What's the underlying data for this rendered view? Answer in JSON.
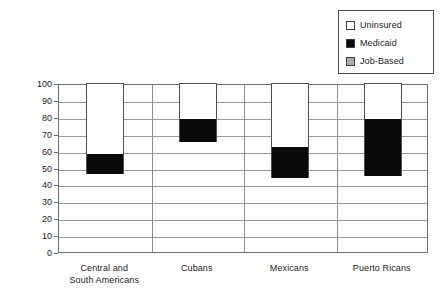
{
  "chart_data": {
    "type": "bar",
    "subtype": "stacked-bar",
    "title": "",
    "xlabel": "",
    "ylabel": "Health Insurance Coverage (percent)",
    "ylim": [
      0,
      100
    ],
    "ytick_step": 10,
    "yticks": [
      100,
      90,
      80,
      70,
      60,
      50,
      40,
      30,
      20,
      10,
      0
    ],
    "grid": "horizontal-and-vertical",
    "legend_position": "top-right",
    "categories": [
      "Central and South Americans",
      "Cubans",
      "Mexicans",
      "Puerto Ricans"
    ],
    "category_lines": [
      [
        "Central and",
        "South Americans"
      ],
      [
        "Cubans",
        ""
      ],
      [
        "Mexicans",
        ""
      ],
      [
        "Puerto Ricans",
        ""
      ]
    ],
    "series": [
      {
        "name": "Job-Based",
        "color": "#ababab",
        "values": [
          46,
          65,
          44,
          45
        ]
      },
      {
        "name": "Medicaid",
        "color": "#0a0a0a",
        "values": [
          12,
          14,
          18,
          34
        ]
      },
      {
        "name": "Uninsured",
        "color": "#ffffff",
        "values": [
          42,
          21,
          38,
          21
        ]
      }
    ],
    "stack_tops": [
      58,
      79,
      62,
      79
    ]
  },
  "legend": {
    "items": [
      {
        "label": "Uninsured",
        "color": "#ffffff"
      },
      {
        "label": "Medicaid",
        "color": "#0a0a0a"
      },
      {
        "label": "Job-Based",
        "color": "#ababab"
      }
    ]
  },
  "colors": {
    "axis": "#6e6e6e",
    "gridline": "#9a9a9a",
    "bar_outline": "#4e4e4e",
    "text": "#1a1a1a",
    "background": "#ffffff"
  }
}
